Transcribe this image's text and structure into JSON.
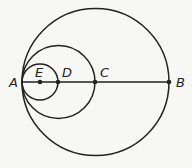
{
  "diagram": {
    "colors": {
      "stroke": "#222222",
      "background": "#f7f7f5"
    },
    "points": [
      {
        "id": "A",
        "label": "A",
        "x": 22,
        "y": 82
      },
      {
        "id": "E",
        "label": "E",
        "x": 40,
        "y": 82
      },
      {
        "id": "D",
        "label": "D",
        "x": 58,
        "y": 82
      },
      {
        "id": "C",
        "label": "C",
        "x": 95,
        "y": 82
      },
      {
        "id": "B",
        "label": "B",
        "x": 169,
        "y": 82
      }
    ],
    "circles": [
      {
        "name": "large-circle",
        "cx": 95.5,
        "cy": 82,
        "r": 73.5
      },
      {
        "name": "medium-circle",
        "cx": 58.5,
        "cy": 82,
        "r": 36.5
      },
      {
        "name": "small-circle",
        "cx": 40,
        "cy": 82,
        "r": 18
      }
    ],
    "segment": {
      "from": "A",
      "to": "B"
    }
  }
}
